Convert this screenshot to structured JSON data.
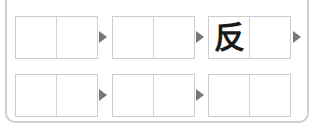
{
  "puzzle": {
    "rows": [
      {
        "words": [
          {
            "cells": [
              "",
              ""
            ]
          },
          {
            "cells": [
              "",
              ""
            ]
          },
          {
            "cells": [
              "反",
              ""
            ]
          }
        ],
        "trailing_arrow": true
      },
      {
        "words": [
          {
            "cells": [
              "",
              ""
            ]
          },
          {
            "cells": [
              "",
              ""
            ]
          },
          {
            "cells": [
              "",
              ""
            ]
          }
        ],
        "trailing_arrow": false
      }
    ],
    "colors": {
      "box_border": "#cdcdcd",
      "arrow": "#777777",
      "frame_border": "#cfcfcf",
      "text": "#1a1a1a"
    }
  }
}
